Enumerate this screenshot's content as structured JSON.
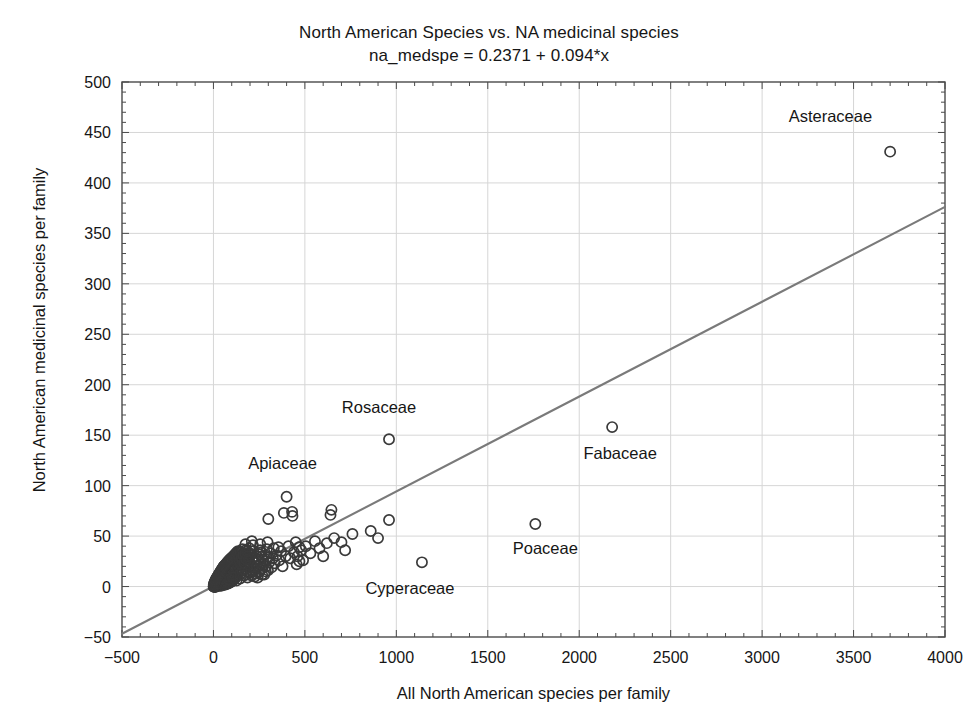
{
  "chart_data": {
    "type": "scatter",
    "title": "North American Species vs. NA medicinal species",
    "subtitle": "na_medspe = 0.2371 + 0.094*x",
    "xlabel": "All North American species per family",
    "ylabel": "North American medicinal species per family",
    "xlim": [
      -500,
      4000
    ],
    "ylim": [
      -50,
      500
    ],
    "xticks": [
      -500,
      0,
      500,
      1000,
      1500,
      2000,
      2500,
      3000,
      3500,
      4000
    ],
    "yticks": [
      -50,
      0,
      50,
      100,
      150,
      200,
      250,
      300,
      350,
      400,
      450,
      500
    ],
    "xtick_labels": [
      "-500",
      "0",
      "500",
      "1000",
      "1500",
      "2000",
      "2500",
      "3000",
      "3500",
      "4000"
    ],
    "ytick_labels": [
      "-50",
      "0",
      "50",
      "100",
      "150",
      "200",
      "250",
      "300",
      "350",
      "400",
      "450",
      "500"
    ],
    "grid": true,
    "minor_ticks": true,
    "marker": "open-circle",
    "marker_color": "#3a3a3a",
    "fit_line": {
      "intercept": 0.2371,
      "slope": 0.094,
      "color": "#7a7a7a",
      "equation": "na_medspe = 0.2371 + 0.094*x"
    },
    "annotations": [
      {
        "label": "Asteraceae",
        "x": 3700,
        "y": 431,
        "dx": -18,
        "dy": -30,
        "anchor": "end"
      },
      {
        "label": "Rosaceae",
        "x": 960,
        "y": 146,
        "dx": -10,
        "dy": -26,
        "anchor": "middle"
      },
      {
        "label": "Fabaceae",
        "x": 2180,
        "y": 158,
        "dx": 8,
        "dy": 32,
        "anchor": "middle"
      },
      {
        "label": "Apiaceae",
        "x": 400,
        "y": 89,
        "dx": -4,
        "dy": -28,
        "anchor": "middle"
      },
      {
        "label": "Poaceae",
        "x": 1760,
        "y": 62,
        "dx": 10,
        "dy": 30,
        "anchor": "middle"
      },
      {
        "label": "Cyperaceae",
        "x": 1140,
        "y": 24,
        "dx": -12,
        "dy": 32,
        "anchor": "middle"
      }
    ],
    "points": [
      [
        3700,
        431
      ],
      [
        2180,
        158
      ],
      [
        960,
        146
      ],
      [
        1760,
        62
      ],
      [
        1140,
        24
      ],
      [
        400,
        89
      ],
      [
        385,
        73
      ],
      [
        430,
        74
      ],
      [
        432,
        70
      ],
      [
        300,
        67
      ],
      [
        640,
        71
      ],
      [
        645,
        76
      ],
      [
        620,
        43
      ],
      [
        760,
        52
      ],
      [
        960,
        66
      ],
      [
        210,
        45
      ],
      [
        175,
        42
      ],
      [
        255,
        36
      ],
      [
        250,
        32
      ],
      [
        265,
        30
      ],
      [
        300,
        29
      ],
      [
        330,
        38
      ],
      [
        355,
        39
      ],
      [
        470,
        39
      ],
      [
        455,
        22
      ],
      [
        470,
        25
      ],
      [
        245,
        20
      ],
      [
        230,
        18
      ],
      [
        215,
        15
      ],
      [
        205,
        14
      ],
      [
        185,
        22
      ],
      [
        195,
        28
      ],
      [
        165,
        26
      ],
      [
        155,
        24
      ],
      [
        150,
        19
      ],
      [
        140,
        17
      ],
      [
        135,
        14
      ],
      [
        130,
        12
      ],
      [
        125,
        10
      ],
      [
        120,
        9
      ],
      [
        115,
        8
      ],
      [
        110,
        7
      ],
      [
        105,
        6
      ],
      [
        100,
        5
      ],
      [
        95,
        5
      ],
      [
        90,
        4
      ],
      [
        85,
        4
      ],
      [
        80,
        3
      ],
      [
        75,
        3
      ],
      [
        70,
        3
      ],
      [
        65,
        2
      ],
      [
        60,
        2
      ],
      [
        55,
        2
      ],
      [
        50,
        2
      ],
      [
        45,
        1
      ],
      [
        40,
        1
      ],
      [
        35,
        1
      ],
      [
        30,
        1
      ],
      [
        25,
        1
      ],
      [
        20,
        1
      ],
      [
        15,
        0
      ],
      [
        12,
        0
      ],
      [
        10,
        0
      ],
      [
        8,
        0
      ],
      [
        6,
        0
      ],
      [
        5,
        0
      ],
      [
        4,
        0
      ],
      [
        3,
        0
      ],
      [
        2,
        0
      ],
      [
        1,
        0
      ],
      [
        18,
        3
      ],
      [
        22,
        5
      ],
      [
        28,
        6
      ],
      [
        33,
        8
      ],
      [
        38,
        9
      ],
      [
        44,
        11
      ],
      [
        48,
        12
      ],
      [
        52,
        13
      ],
      [
        58,
        14
      ],
      [
        62,
        15
      ],
      [
        68,
        16
      ],
      [
        72,
        12
      ],
      [
        78,
        10
      ],
      [
        82,
        13
      ],
      [
        88,
        15
      ],
      [
        92,
        17
      ],
      [
        98,
        18
      ],
      [
        102,
        12
      ],
      [
        108,
        16
      ],
      [
        112,
        19
      ],
      [
        118,
        20
      ],
      [
        122,
        14
      ],
      [
        128,
        22
      ],
      [
        132,
        18
      ],
      [
        138,
        21
      ],
      [
        142,
        24
      ],
      [
        148,
        13
      ],
      [
        152,
        27
      ],
      [
        158,
        16
      ],
      [
        162,
        20
      ],
      [
        168,
        29
      ],
      [
        172,
        18
      ],
      [
        178,
        31
      ],
      [
        182,
        12
      ],
      [
        188,
        25
      ],
      [
        192,
        14
      ],
      [
        198,
        33
      ],
      [
        202,
        21
      ],
      [
        208,
        11
      ],
      [
        212,
        28
      ],
      [
        218,
        35
      ],
      [
        222,
        17
      ],
      [
        228,
        24
      ],
      [
        232,
        13
      ],
      [
        238,
        30
      ],
      [
        242,
        9
      ],
      [
        248,
        27
      ],
      [
        252,
        15
      ],
      [
        258,
        22
      ],
      [
        262,
        34
      ],
      [
        268,
        18
      ],
      [
        272,
        26
      ],
      [
        278,
        12
      ],
      [
        282,
        31
      ],
      [
        288,
        20
      ],
      [
        292,
        37
      ],
      [
        298,
        16
      ],
      [
        305,
        24
      ],
      [
        310,
        33
      ],
      [
        318,
        19
      ],
      [
        325,
        28
      ],
      [
        335,
        23
      ],
      [
        345,
        31
      ],
      [
        360,
        26
      ],
      [
        370,
        35
      ],
      [
        378,
        20
      ],
      [
        395,
        30
      ],
      [
        410,
        40
      ],
      [
        420,
        28
      ],
      [
        440,
        34
      ],
      [
        450,
        44
      ],
      [
        460,
        30
      ],
      [
        480,
        36
      ],
      [
        490,
        26
      ],
      [
        505,
        40
      ],
      [
        530,
        33
      ],
      [
        555,
        45
      ],
      [
        580,
        38
      ],
      [
        600,
        30
      ],
      [
        660,
        48
      ],
      [
        700,
        44
      ],
      [
        720,
        36
      ],
      [
        860,
        55
      ],
      [
        900,
        48
      ],
      [
        50,
        8
      ],
      [
        56,
        20
      ],
      [
        64,
        10
      ],
      [
        74,
        22
      ],
      [
        84,
        7
      ],
      [
        96,
        25
      ],
      [
        106,
        9
      ],
      [
        116,
        27
      ],
      [
        126,
        6
      ],
      [
        136,
        29
      ],
      [
        146,
        8
      ],
      [
        156,
        32
      ],
      [
        166,
        11
      ],
      [
        176,
        36
      ],
      [
        186,
        9
      ],
      [
        196,
        38
      ],
      [
        206,
        16
      ],
      [
        216,
        41
      ],
      [
        226,
        10
      ],
      [
        236,
        20
      ],
      [
        246,
        14
      ],
      [
        256,
        42
      ],
      [
        266,
        12
      ],
      [
        276,
        23
      ],
      [
        286,
        15
      ],
      [
        296,
        44
      ],
      [
        2,
        2
      ],
      [
        4,
        3
      ],
      [
        6,
        4
      ],
      [
        8,
        5
      ],
      [
        11,
        6
      ],
      [
        13,
        7
      ],
      [
        16,
        8
      ],
      [
        19,
        9
      ],
      [
        23,
        10
      ],
      [
        26,
        11
      ],
      [
        29,
        12
      ],
      [
        32,
        13
      ],
      [
        36,
        14
      ],
      [
        39,
        15
      ],
      [
        42,
        16
      ],
      [
        46,
        17
      ],
      [
        49,
        18
      ],
      [
        53,
        19
      ],
      [
        57,
        20
      ],
      [
        61,
        21
      ],
      [
        66,
        22
      ],
      [
        71,
        23
      ],
      [
        76,
        24
      ],
      [
        81,
        25
      ],
      [
        86,
        26
      ],
      [
        91,
        27
      ],
      [
        97,
        28
      ],
      [
        103,
        29
      ],
      [
        109,
        30
      ],
      [
        114,
        31
      ],
      [
        119,
        32
      ],
      [
        124,
        33
      ],
      [
        129,
        34
      ],
      [
        134,
        35
      ],
      [
        139,
        30
      ],
      [
        144,
        25
      ],
      [
        149,
        34
      ],
      [
        154,
        29
      ],
      [
        159,
        37
      ],
      [
        164,
        31
      ],
      [
        169,
        23
      ],
      [
        174,
        33
      ],
      [
        179,
        27
      ],
      [
        184,
        35
      ],
      [
        189,
        30
      ]
    ]
  }
}
